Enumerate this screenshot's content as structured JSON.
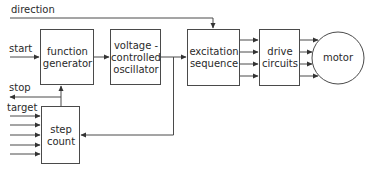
{
  "diagram": {
    "type": "block-diagram",
    "colors": {
      "line": "#4a4a4a",
      "background": "#ffffff",
      "text": "#2a2a2a"
    },
    "inputs": {
      "direction": "direction",
      "start": "start",
      "stop": "stop",
      "target": "target"
    },
    "blocks": {
      "function_generator": {
        "line1": "function",
        "line2": "generator"
      },
      "vco": {
        "line1": "voltage -",
        "line2": "controlled",
        "line3": "oscillator"
      },
      "excitation": {
        "line1": "excitation",
        "line2": "sequence"
      },
      "drive": {
        "line1": "drive",
        "line2": "circuits"
      },
      "motor": {
        "label": "motor"
      },
      "step_count": {
        "line1": "step",
        "line2": "count"
      }
    },
    "connections": [
      {
        "from": "start",
        "to": "function generator"
      },
      {
        "from": "function generator",
        "to": "voltage-controlled oscillator"
      },
      {
        "from": "voltage-controlled oscillator",
        "to": "excitation sequence"
      },
      {
        "from": "voltage-controlled oscillator",
        "to": "step count"
      },
      {
        "from": "direction",
        "to": "excitation sequence"
      },
      {
        "from": "excitation sequence",
        "to": "drive circuits",
        "count": 4
      },
      {
        "from": "drive circuits",
        "to": "motor",
        "count": 4
      },
      {
        "from": "step count",
        "to": "function generator"
      },
      {
        "from": "step count",
        "to": "stop"
      },
      {
        "from": "target",
        "to": "step count",
        "count": 5
      }
    ]
  }
}
